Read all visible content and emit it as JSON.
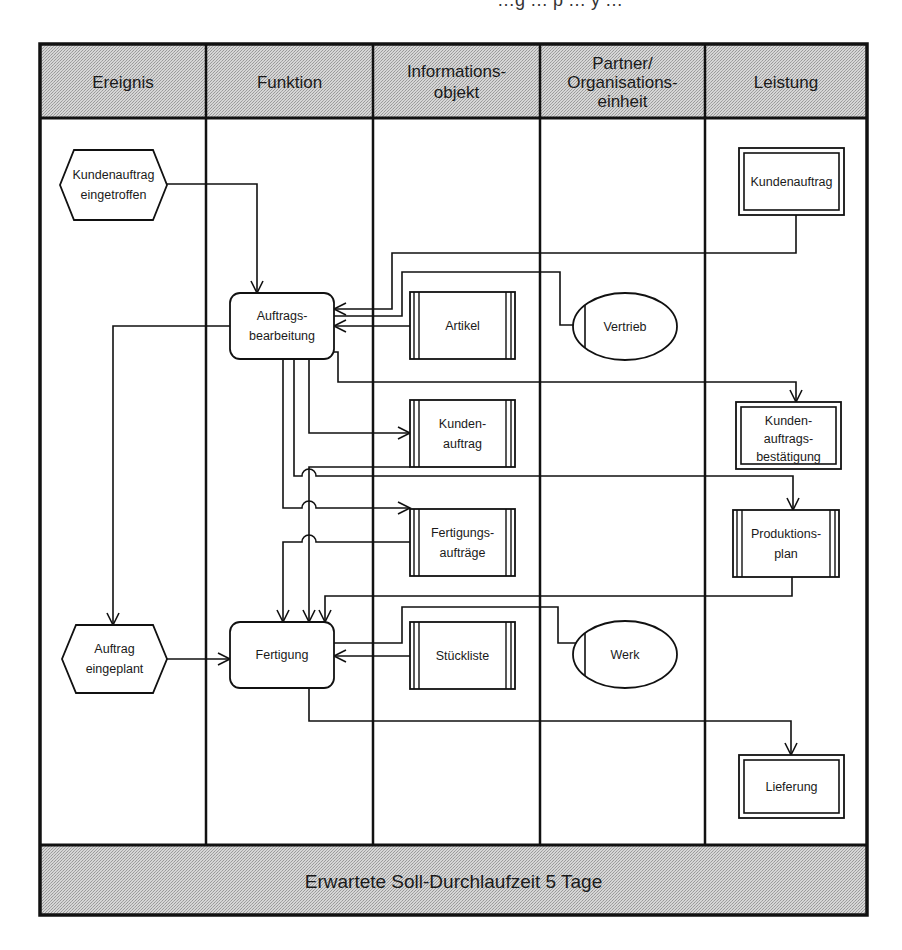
{
  "page": {
    "cut_off_top_text": "…g … p … y …"
  },
  "colors": {
    "header_fill": "#c8c8c8",
    "line": "#111111",
    "background": "#ffffff"
  },
  "frame": {
    "left": 40,
    "top": 44,
    "right": 867,
    "bottom": 915
  },
  "header": {
    "bottom": 118,
    "columns": [
      {
        "id": "ereignis",
        "label_lines": [
          "Ereignis"
        ],
        "x0": 40,
        "x1": 206
      },
      {
        "id": "funktion",
        "label_lines": [
          "Funktion"
        ],
        "x0": 206,
        "x1": 373
      },
      {
        "id": "informationsobjekt",
        "label_lines": [
          "Informations-",
          "objekt"
        ],
        "x0": 373,
        "x1": 540
      },
      {
        "id": "partner",
        "label_lines": [
          "Partner/",
          "Organisations-",
          "einheit"
        ],
        "x0": 540,
        "x1": 705
      },
      {
        "id": "leistung",
        "label_lines": [
          "Leistung"
        ],
        "x0": 705,
        "x1": 867
      }
    ]
  },
  "footer": {
    "top": 845,
    "label": "Erwartete Soll-Durchlaufzeit 5 Tage"
  },
  "nodes": [
    {
      "id": "ev-kundenauftrag-eingetroffen",
      "type": "event",
      "lines": [
        "Kundenauftrag",
        "eingetroffen"
      ],
      "x": 60,
      "y": 150,
      "w": 107,
      "h": 70
    },
    {
      "id": "ev-auftrag-eingeplant",
      "type": "event",
      "lines": [
        "Auftrag",
        "eingeplant"
      ],
      "x": 62,
      "y": 625,
      "w": 105,
      "h": 68
    },
    {
      "id": "fn-auftragsbearbeitung",
      "type": "function",
      "lines": [
        "Auftrags-",
        "bearbeitung"
      ],
      "x": 230,
      "y": 293,
      "w": 104,
      "h": 66
    },
    {
      "id": "fn-fertigung",
      "type": "function",
      "lines": [
        "Fertigung"
      ],
      "x": 230,
      "y": 622,
      "w": 104,
      "h": 66
    },
    {
      "id": "io-artikel",
      "type": "info",
      "lines": [
        "Artikel"
      ],
      "x": 410,
      "y": 292,
      "w": 105,
      "h": 67
    },
    {
      "id": "io-kundenauftrag",
      "type": "info",
      "lines": [
        "Kunden-",
        "auftrag"
      ],
      "x": 410,
      "y": 400,
      "w": 105,
      "h": 67
    },
    {
      "id": "io-fertigungsauftraege",
      "type": "info",
      "lines": [
        "Fertigungs-",
        "aufträge"
      ],
      "x": 410,
      "y": 509,
      "w": 105,
      "h": 67
    },
    {
      "id": "io-stueckliste",
      "type": "info",
      "lines": [
        "Stückliste"
      ],
      "x": 410,
      "y": 622,
      "w": 105,
      "h": 67
    },
    {
      "id": "org-vertrieb",
      "type": "org",
      "lines": [
        "Vertrieb"
      ],
      "x": 573,
      "y": 293,
      "w": 104,
      "h": 67
    },
    {
      "id": "org-werk",
      "type": "org",
      "lines": [
        "Werk"
      ],
      "x": 573,
      "y": 621,
      "w": 104,
      "h": 67
    },
    {
      "id": "ls-kundenauftrag",
      "type": "service",
      "lines": [
        "Kundenauftrag"
      ],
      "x": 739,
      "y": 148,
      "w": 105,
      "h": 67
    },
    {
      "id": "ls-kundenauftragsbestaetigung",
      "type": "service",
      "lines": [
        "Kunden-",
        "auftrags-",
        "bestätigung"
      ],
      "x": 736,
      "y": 402,
      "w": 105,
      "h": 67
    },
    {
      "id": "ls-produktionsplan",
      "type": "info",
      "lines": [
        "Produktions-",
        "plan"
      ],
      "x": 733,
      "y": 510,
      "w": 106,
      "h": 67
    },
    {
      "id": "ls-lieferung",
      "type": "service",
      "lines": [
        "Lieferung"
      ],
      "x": 739,
      "y": 755,
      "w": 105,
      "h": 63
    }
  ],
  "edges": [
    {
      "id": "e1",
      "points": [
        [
          167,
          184
        ],
        [
          257,
          184
        ],
        [
          257,
          293
        ]
      ],
      "arrow": "end"
    },
    {
      "id": "e2",
      "points": [
        [
          796,
          215
        ],
        [
          796,
          253
        ],
        [
          392,
          253
        ],
        [
          392,
          309
        ],
        [
          334,
          309
        ]
      ],
      "arrow": "end"
    },
    {
      "id": "e3",
      "points": [
        [
          578,
          325
        ],
        [
          560,
          325
        ],
        [
          560,
          272
        ],
        [
          402,
          272
        ],
        [
          402,
          316
        ],
        [
          334,
          316
        ]
      ],
      "arrow": "none"
    },
    {
      "id": "e4",
      "points": [
        [
          410,
          326
        ],
        [
          334,
          326
        ]
      ],
      "arrow": "end"
    },
    {
      "id": "e5",
      "points": [
        [
          230,
          326
        ],
        [
          113,
          326
        ],
        [
          113,
          625
        ]
      ],
      "arrow": "end"
    },
    {
      "id": "e6",
      "points": [
        [
          334,
          352
        ],
        [
          338,
          352
        ],
        [
          338,
          382
        ],
        [
          796,
          382
        ],
        [
          796,
          402
        ]
      ],
      "arrow": "end"
    },
    {
      "id": "e7",
      "points": [
        [
          309,
          359
        ],
        [
          309,
          433
        ],
        [
          410,
          433
        ]
      ],
      "arrow": "end"
    },
    {
      "id": "e8",
      "points": [
        [
          294,
          359
        ],
        [
          294,
          476
        ],
        [
          793,
          476
        ],
        [
          793,
          510
        ]
      ],
      "arrow": "end",
      "hops": [
        [
          309,
          476
        ]
      ]
    },
    {
      "id": "e9",
      "points": [
        [
          283,
          359
        ],
        [
          283,
          508
        ],
        [
          410,
          508
        ]
      ],
      "arrow": "end",
      "hops": [
        [
          309,
          508
        ]
      ]
    },
    {
      "id": "e10",
      "points": [
        [
          410,
          542
        ],
        [
          283,
          542
        ],
        [
          283,
          622
        ]
      ],
      "arrow": "end",
      "hops": [
        [
          309,
          542
        ]
      ]
    },
    {
      "id": "e11",
      "points": [
        [
          410,
          467
        ],
        [
          309,
          467
        ],
        [
          309,
          622
        ]
      ],
      "arrow": "end"
    },
    {
      "id": "e12",
      "points": [
        [
          792,
          577
        ],
        [
          792,
          596
        ],
        [
          325,
          596
        ],
        [
          325,
          622
        ]
      ],
      "arrow": "end"
    },
    {
      "id": "e13",
      "points": [
        [
          578,
          643
        ],
        [
          558,
          643
        ],
        [
          558,
          607
        ],
        [
          402,
          607
        ],
        [
          402,
          643
        ],
        [
          334,
          643
        ]
      ],
      "arrow": "none"
    },
    {
      "id": "e14",
      "points": [
        [
          410,
          656
        ],
        [
          334,
          656
        ]
      ],
      "arrow": "end"
    },
    {
      "id": "e15",
      "points": [
        [
          167,
          659
        ],
        [
          230,
          659
        ]
      ],
      "arrow": "end"
    },
    {
      "id": "e16",
      "points": [
        [
          309,
          688
        ],
        [
          309,
          721
        ],
        [
          791,
          721
        ],
        [
          791,
          755
        ]
      ],
      "arrow": "end"
    }
  ]
}
